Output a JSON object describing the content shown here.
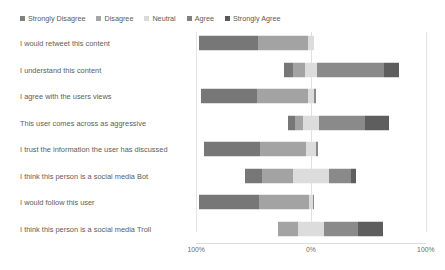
{
  "chart_data": {
    "type": "bar",
    "subtype": "diverging-stacked-likert",
    "title": "",
    "xlabel": "",
    "ylabel": "",
    "grid": true,
    "legend_position": "top-left",
    "xlim": [
      -100,
      100
    ],
    "axis_ticks": [
      {
        "label": "100%",
        "value": -100
      },
      {
        "label": "0%",
        "value": 0
      },
      {
        "label": "100%",
        "value": 100
      }
    ],
    "legend": [
      {
        "name": "Strongly Disagree",
        "color": "#808080"
      },
      {
        "name": "Disagree",
        "color": "#a6a6a6"
      },
      {
        "name": "Neutral",
        "color": "#d9d9d9"
      },
      {
        "name": "Agree",
        "color": "#808080"
      },
      {
        "name": "Strongly Agree",
        "color": "#595959"
      }
    ],
    "series": [
      {
        "name": "Strongly Disagree",
        "color": "#777777"
      },
      {
        "name": "Disagree",
        "color": "#a3a3a3"
      },
      {
        "name": "Neutral",
        "color": "#dcdcdc"
      },
      {
        "name": "Agree",
        "color": "#8a8a8a"
      },
      {
        "name": "Strongly Agree",
        "color": "#5e5e5e"
      }
    ],
    "categories": [
      "I would retweet this content",
      "I understand this content",
      "I agree with the users views",
      "This user comes across as aggressive",
      "I trust the information the user has discussed",
      "I think this person is a social media Bot",
      "I would follow this user",
      "I think this person is a social media Troll"
    ],
    "rows": [
      {
        "category": "I would retweet this content",
        "values": {
          "strongly_disagree": 51,
          "disagree": 44,
          "neutral": 5,
          "agree": 0,
          "strongly_agree": 0
        }
      },
      {
        "category": "I understand this content",
        "values": {
          "strongly_disagree": 8,
          "disagree": 10,
          "neutral": 11,
          "agree": 58,
          "strongly_agree": 13
        }
      },
      {
        "category": "I agree with the users views",
        "values": {
          "strongly_disagree": 49,
          "disagree": 44,
          "neutral": 6,
          "agree": 1,
          "strongly_agree": 0
        }
      },
      {
        "category": "This user comes across as aggressive",
        "values": {
          "strongly_disagree": 6,
          "disagree": 7,
          "neutral": 14,
          "agree": 40,
          "strongly_agree": 21
        }
      },
      {
        "category": "I trust the information the user has discussed",
        "values": {
          "strongly_disagree": 49,
          "disagree": 40,
          "neutral": 9,
          "agree": 2,
          "strongly_agree": 0
        }
      },
      {
        "category": "I think this person is a social media Bot",
        "values": {
          "strongly_disagree": 15,
          "disagree": 27,
          "neutral": 31,
          "agree": 19,
          "strongly_agree": 5
        }
      },
      {
        "category": "I would follow this user",
        "values": {
          "strongly_disagree": 52,
          "disagree": 44,
          "neutral": 3,
          "agree": 1,
          "strongly_agree": 0
        }
      },
      {
        "category": "I think this person is a social media Troll",
        "values": {
          "strongly_disagree": 0,
          "disagree": 18,
          "neutral": 22,
          "agree": 30,
          "strongly_agree": 22
        }
      }
    ]
  }
}
